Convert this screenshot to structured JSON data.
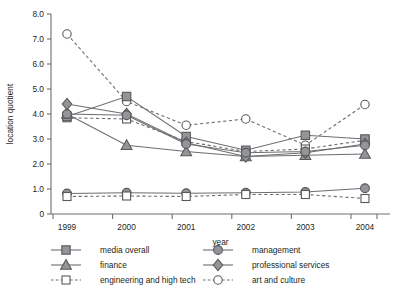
{
  "chart_data": {
    "type": "line",
    "title": "",
    "xlabel": "year",
    "ylabel": "location quotient",
    "categories": [
      "1999",
      "2000",
      "2001",
      "2002",
      "2003",
      "2004"
    ],
    "x": [
      1999,
      2000,
      2001,
      2002,
      2003,
      2004
    ],
    "xlim": [
      1999,
      2004
    ],
    "ylim": [
      0,
      8.0
    ],
    "yticks": [
      "0",
      "1.0",
      "2.0",
      "3.0",
      "4.0",
      "5.0",
      "6.0",
      "7.0",
      "8.0"
    ],
    "ytick_values": [
      0,
      1.0,
      2.0,
      3.0,
      4.0,
      5.0,
      6.0,
      7.0,
      8.0
    ],
    "grid": false,
    "legend_position": "below",
    "series": [
      {
        "name": "media overall",
        "marker": "square-filled",
        "line": "solid",
        "color": "#939598",
        "values": [
          3.9,
          4.7,
          3.1,
          2.55,
          3.15,
          3.0
        ]
      },
      {
        "name": "finance",
        "marker": "triangle-filled",
        "line": "solid",
        "color": "#939598",
        "values": [
          4.0,
          2.75,
          2.5,
          2.3,
          2.35,
          2.4
        ]
      },
      {
        "name": "engineering and high tech",
        "marker": "square-open",
        "line": "dashed",
        "color": "#939598",
        "values": [
          0.7,
          3.8,
          0.7,
          0.78,
          0.78,
          0.62
        ]
      },
      {
        "name": "management",
        "marker": "circle-filled",
        "line": "solid",
        "color": "#939598",
        "values": [
          0.82,
          0.85,
          0.83,
          0.85,
          0.88,
          1.03
        ]
      },
      {
        "name": "professional services",
        "marker": "diamond-filled",
        "line": "solid",
        "color": "#939598",
        "values": [
          4.4,
          4.0,
          2.85,
          2.3,
          2.45,
          2.8
        ]
      },
      {
        "name": "art and culture",
        "marker": "circle-open",
        "line": "dashed",
        "color": "#ffffff",
        "values": [
          7.2,
          4.5,
          3.55,
          3.8,
          2.75,
          4.38
        ]
      }
    ],
    "extra_series_notes": [
      {
        "name": "management-upper",
        "marker": "circle-filled",
        "line": "solid",
        "values": [
          4.0,
          3.95,
          2.8,
          2.45,
          2.5,
          2.75
        ]
      },
      {
        "name": "engineering-upper",
        "marker": "square-open",
        "line": "dashed",
        "values": [
          3.85,
          3.8,
          2.9,
          2.5,
          2.6,
          2.95
        ]
      }
    ]
  },
  "legend": {
    "items": [
      {
        "label": "media overall",
        "marker": "square-filled",
        "line": "solid"
      },
      {
        "label": "management",
        "marker": "circle-filled",
        "line": "solid"
      },
      {
        "label": "finance",
        "marker": "triangle-filled",
        "line": "solid"
      },
      {
        "label": "professional services",
        "marker": "diamond-filled",
        "line": "solid"
      },
      {
        "label": "engineering and high tech",
        "marker": "square-open",
        "line": "dashed"
      },
      {
        "label": "art and culture",
        "marker": "circle-open",
        "line": "dashed"
      }
    ]
  },
  "colors": {
    "marker_fill": "#939598",
    "marker_stroke": "#58595b",
    "line": "#6d6e71",
    "text": "#231f20",
    "background": "#ffffff"
  }
}
